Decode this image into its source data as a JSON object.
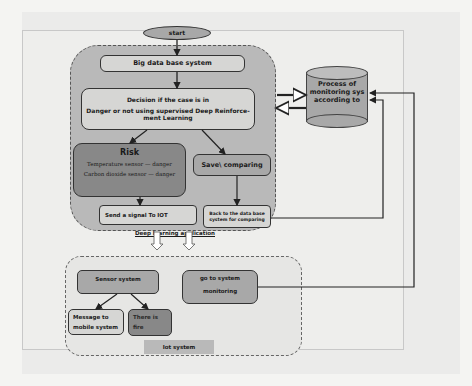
{
  "diagram": {
    "start": "start",
    "app_group": {
      "label": "Deep learning application",
      "big_data": "Big data base system",
      "decision": {
        "line1": "Decision if the case is in",
        "line2": "Danger or not using supervised Deep Reinforce-",
        "line3": "ment Learning"
      },
      "risk": {
        "title": "Risk",
        "line1": "Temperature sensor — danger",
        "line2": "Carbon dioxide sensor — danger"
      },
      "save_comparing": "Save\\ comparing",
      "send_signal": "Send a signal To IOT",
      "back_to_db": {
        "line1": "Back to the data base",
        "line2": "system for comparing"
      }
    },
    "database": {
      "line1": "Process of",
      "line2": "monitoring sys",
      "line3": "according to"
    },
    "iot_group": {
      "label": "Iot system",
      "sensor_system": "Sensor system",
      "go_to_monitoring": {
        "line1": "go to system",
        "line2": "monitoring"
      },
      "message_mobile": {
        "line1": "Message to",
        "line2": "mobile system"
      },
      "there_is_fire": {
        "line1": "There is",
        "line2": "fire"
      }
    }
  }
}
